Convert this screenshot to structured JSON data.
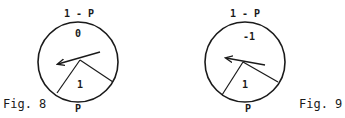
{
  "figures": [
    {
      "caption": "Fig. 8",
      "top_label": "1 - P",
      "upper_region_label": "0",
      "lower_region_label": "1",
      "bottom_label": "P"
    },
    {
      "caption": "Fig. 9",
      "top_label": "1 - P",
      "upper_region_label": "-1",
      "lower_region_label": "1",
      "bottom_label": "P"
    }
  ],
  "colors": {
    "ink": "#1a1a1a",
    "background": "#ffffff"
  }
}
